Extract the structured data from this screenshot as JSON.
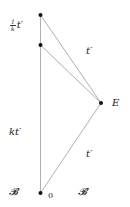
{
  "diagram": {
    "type": "spacetime-diagram",
    "points": {
      "origin": {
        "x": 41,
        "y": 193,
        "label": "0"
      },
      "top": {
        "x": 40,
        "y": 15
      },
      "mid": {
        "x": 40,
        "y": 45
      },
      "E": {
        "x": 101,
        "y": 103,
        "label": "E"
      }
    },
    "lines": [
      {
        "from": "origin",
        "to": "top"
      },
      {
        "from": "top",
        "to": "E"
      },
      {
        "from": "mid",
        "to": "E"
      },
      {
        "from": "origin",
        "to": "E"
      }
    ],
    "colors": {
      "line": "#9a9a9a",
      "point": "#111111",
      "text": "#222222"
    }
  },
  "labels": {
    "top_fraction_num": "1",
    "top_fraction_den": "k",
    "top_var": "t′",
    "upper_edge": "t′",
    "event": "E",
    "left_mid": "kt′",
    "lower_edge": "t′",
    "frame_B": "𝓑",
    "frame_B_prime": "𝓑′",
    "origin": "0"
  }
}
